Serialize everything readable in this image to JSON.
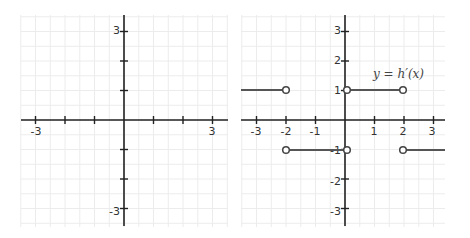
{
  "chart_data": [
    {
      "type": "line",
      "title": "",
      "xlabel": "",
      "ylabel": "",
      "xlim": [
        -3.5,
        3.5
      ],
      "ylim": [
        -3.5,
        3.5
      ],
      "grid": true,
      "grid_step": 0.5,
      "x_ticks": [
        -3,
        -2,
        -1,
        1,
        2,
        3
      ],
      "x_tick_labels": [
        "-3",
        "",
        "",
        "",
        "",
        "3"
      ],
      "y_ticks": [
        -3,
        -2,
        -1,
        1,
        2,
        3
      ],
      "y_tick_labels": [
        "-3",
        "",
        "",
        "",
        "",
        "3"
      ],
      "series": []
    },
    {
      "type": "line",
      "title": "",
      "annotation": "y = h′(x)",
      "xlabel": "",
      "ylabel": "",
      "xlim": [
        -3.5,
        3.5
      ],
      "ylim": [
        -3.5,
        3.5
      ],
      "grid": true,
      "grid_step": 0.5,
      "x_ticks": [
        -3,
        -2,
        -1,
        1,
        2,
        3
      ],
      "x_tick_labels": [
        "-3",
        "-2",
        "-1",
        "1",
        "2",
        "3"
      ],
      "y_ticks": [
        -3,
        -2,
        -1,
        1,
        2,
        3
      ],
      "y_tick_labels": [
        "-3",
        "-2",
        "-1",
        "1",
        "2",
        "3"
      ],
      "series": [
        {
          "name": "h'(x) segment 1",
          "x": [
            -3.5,
            -2
          ],
          "y": [
            1,
            1
          ],
          "open_endpoints": [
            -2
          ]
        },
        {
          "name": "h'(x) segment 2",
          "x": [
            -2,
            0
          ],
          "y": [
            -1,
            -1
          ],
          "open_endpoints": [
            -2,
            0
          ]
        },
        {
          "name": "h'(x) segment 3",
          "x": [
            0,
            2
          ],
          "y": [
            1,
            1
          ],
          "open_endpoints": [
            0,
            2
          ]
        },
        {
          "name": "h'(x) segment 4",
          "x": [
            2,
            3.5
          ],
          "y": [
            -1,
            -1
          ],
          "open_endpoints": [
            2
          ]
        }
      ]
    }
  ],
  "panels": {
    "left": {
      "x_labels": {
        "neg3": "-3",
        "pos3": "3"
      },
      "y_labels": {
        "pos3": "3",
        "neg3": "-3"
      }
    },
    "right": {
      "x_labels": {
        "neg3": "-3",
        "neg2": "-2",
        "neg1": "-1",
        "pos1": "1",
        "pos2": "2",
        "pos3": "3"
      },
      "y_labels": {
        "pos3": "3",
        "pos2": "2",
        "pos1": "1",
        "neg1": "-1",
        "neg2": "-2",
        "neg3": "-3"
      },
      "function_label": "y = h′(x)"
    }
  }
}
